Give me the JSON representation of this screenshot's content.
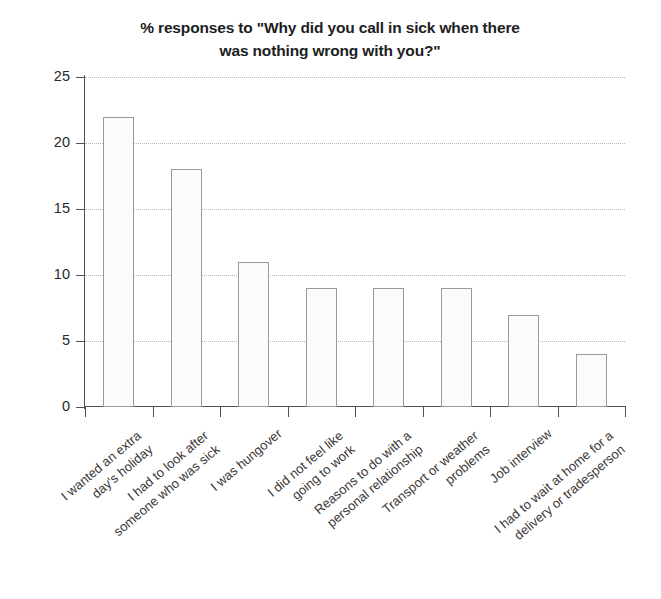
{
  "chart_data": {
    "type": "bar",
    "title": "% responses to \"Why did you call in sick when there was nothing wrong with you?\"",
    "title_lines": [
      "% responses to \"Why did you call in sick when there",
      "was nothing wrong with you?\""
    ],
    "xlabel": "",
    "ylabel": "",
    "ylim": [
      0,
      25
    ],
    "yticks": [
      0,
      5,
      10,
      15,
      20,
      25
    ],
    "ytick_labels": [
      "0",
      "5",
      "10",
      "15",
      "20",
      "25"
    ],
    "grid": true,
    "legend": "none",
    "categories": [
      "I wanted an extra day's holiday",
      "I had to look after someone who was sick",
      "I was hungover",
      "I did not feel like going to work",
      "Reasons to do with a personal relationship",
      "Transport or weather problems",
      "Job interview",
      "I had to wait at home for a delivery or tradesperson"
    ],
    "category_lines": [
      [
        "I wanted an extra",
        "day's holiday"
      ],
      [
        "I had to look after",
        "someone who was sick"
      ],
      [
        "I was hungover",
        ""
      ],
      [
        "I did not feel like",
        "going to work"
      ],
      [
        "Reasons to do with a",
        "personal relationship"
      ],
      [
        "Transport or weather",
        "problems"
      ],
      [
        "Job interview",
        ""
      ],
      [
        "I had to wait at home for a",
        "delivery or tradesperson"
      ]
    ],
    "values": [
      22,
      18,
      11,
      9,
      9,
      9,
      7,
      4
    ],
    "colors": {
      "bar_fill": "#fbfbfb",
      "bar_border": "#9a9a9a",
      "gridline": "#b9b9b9",
      "axis": "#54514f",
      "text": "#231f20",
      "background": "#ffffff"
    }
  }
}
